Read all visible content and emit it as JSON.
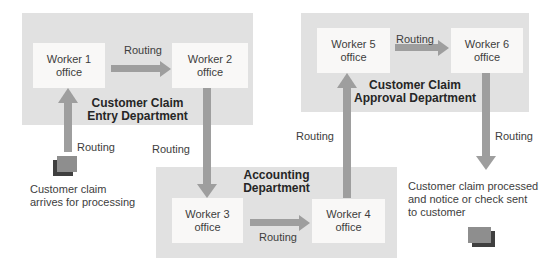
{
  "colors": {
    "background": "#ffffff",
    "department_fill": "#e1e1e1",
    "worker_box_fill": "#f9f8f7",
    "arrow": "#9e9e9e",
    "text": "#3d3d3d",
    "heading_text": "#262626",
    "icon_front": "#8e8e8e",
    "icon_shadow": "#3f3f3f"
  },
  "departments": [
    {
      "id": "entry",
      "label_line1": "Customer Claim",
      "label_line2": "Entry Department"
    },
    {
      "id": "accounting",
      "label_line1": "Accounting",
      "label_line2": "Department"
    },
    {
      "id": "approval",
      "label_line1": "Customer Claim",
      "label_line2": "Approval Department"
    }
  ],
  "workers": [
    {
      "line1": "Worker 1",
      "line2": "office"
    },
    {
      "line1": "Worker 2",
      "line2": "office"
    },
    {
      "line1": "Worker 3",
      "line2": "office"
    },
    {
      "line1": "Worker 4",
      "line2": "office"
    },
    {
      "line1": "Worker 5",
      "line2": "office"
    },
    {
      "line1": "Worker 6",
      "line2": "office"
    }
  ],
  "routing_labels": [
    {
      "id": "claim-to-worker1",
      "text": "Routing"
    },
    {
      "id": "worker1-to-worker2",
      "text": "Routing"
    },
    {
      "id": "worker2-to-worker3",
      "text": "Routing"
    },
    {
      "id": "worker3-to-worker4",
      "text": "Routing"
    },
    {
      "id": "worker4-to-worker5",
      "text": "Routing"
    },
    {
      "id": "worker5-to-worker6",
      "text": "Routing"
    },
    {
      "id": "worker6-to-customer",
      "text": "Routing"
    }
  ],
  "captions": {
    "start_line1": "Customer claim",
    "start_line2": "arrives for processing",
    "end_line1": "Customer claim processed",
    "end_line2": "and notice or check sent",
    "end_line3": "to customer"
  },
  "icons": [
    {
      "name": "claim-document-icon-start"
    },
    {
      "name": "claim-document-icon-end"
    }
  ]
}
